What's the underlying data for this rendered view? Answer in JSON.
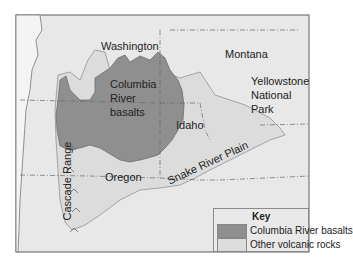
{
  "map": {
    "colors": {
      "background": "#ffffff",
      "land": "#e8e8e8",
      "ocean": "#f4f4f4",
      "columbia_basalts": "#8f8f8f",
      "other_volcanic": "#dcdcdc",
      "border": "#666666"
    },
    "labels": {
      "washington": "Washington",
      "montana": "Montana",
      "columbia_1": "Columbia",
      "columbia_2": "River",
      "columbia_3": "basalts",
      "idaho": "Idaho",
      "yellowstone_1": "Yellowstone",
      "yellowstone_2": "National",
      "yellowstone_3": "Park",
      "oregon": "Oregon",
      "cascade": "Cascade Range",
      "snake": "Snake River Plain"
    },
    "key": {
      "title": "Key",
      "items": [
        {
          "label": "Columbia River basalts",
          "color": "#8f8f8f"
        },
        {
          "label": "Other volcanic rocks",
          "color": "#dcdcdc"
        }
      ]
    }
  }
}
